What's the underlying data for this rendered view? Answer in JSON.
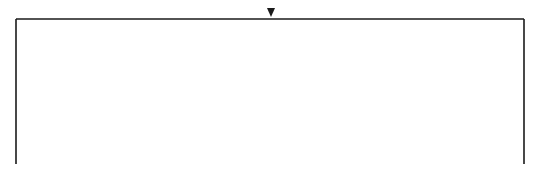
{
  "diagram": {
    "title": "",
    "marker": "center-arrow",
    "stroke_color": "#1a1a1a",
    "background": "#ffffff"
  }
}
